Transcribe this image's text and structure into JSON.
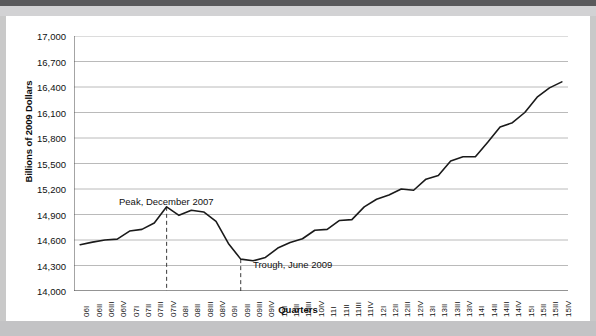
{
  "chart_data": {
    "type": "line",
    "title": "",
    "xlabel": "Quarters",
    "ylabel": "Billions of 2009 Dollars",
    "ylim": [
      14000,
      17000
    ],
    "ytick_step": 300,
    "ytick_labels": [
      "17,000",
      "16,700",
      "16,400",
      "16,100",
      "15,800",
      "15,500",
      "15,200",
      "14,900",
      "14,600",
      "14,300",
      "14,000"
    ],
    "ytick_values": [
      17000,
      16700,
      16400,
      16100,
      15800,
      15500,
      15200,
      14900,
      14600,
      14300,
      14000
    ],
    "grid": true,
    "legend": "none",
    "categories": [
      "06I",
      "06II",
      "06III",
      "06IV",
      "07I",
      "07II",
      "07III",
      "07IV",
      "08I",
      "08II",
      "08III",
      "08IV",
      "09I",
      "09II",
      "09III",
      "09IV",
      "10I",
      "10II",
      "10III",
      "10IV",
      "11I",
      "11II",
      "11III",
      "11IV",
      "12I",
      "12II",
      "12III",
      "12IV",
      "13I",
      "13II",
      "13III",
      "13IV",
      "14I",
      "14II",
      "14III",
      "14IV",
      "15I",
      "15II",
      "15III",
      "15IV"
    ],
    "values": [
      14545,
      14575,
      14600,
      14610,
      14705,
      14725,
      14800,
      14990,
      14890,
      14950,
      14930,
      14820,
      14560,
      14375,
      14355,
      14395,
      14505,
      14570,
      14615,
      14715,
      14725,
      14830,
      14840,
      14990,
      15080,
      15130,
      15200,
      15185,
      15315,
      15360,
      15530,
      15580,
      15580,
      15750,
      15930,
      15980,
      16100,
      16280,
      16390,
      16460
    ],
    "annotations": [
      {
        "name": "peak",
        "label": "Peak, December 2007",
        "x_category": "07IV",
        "value": 14990
      },
      {
        "name": "trough",
        "label": "Trough, June 2009",
        "x_category": "09II",
        "value": 14375
      }
    ],
    "series": [
      {
        "name": "Real GDP",
        "color": "#1a1a1a"
      }
    ]
  },
  "colors": {
    "line": "#1a1a1a",
    "grid": "#a8a8a8",
    "axis": "#4a4a4a",
    "text": "#111111",
    "plot_bg": "#ffffff",
    "page_bg": "#ffffff",
    "outer_bg": "#c9c9c9",
    "top_band": "#5a5a5c"
  }
}
